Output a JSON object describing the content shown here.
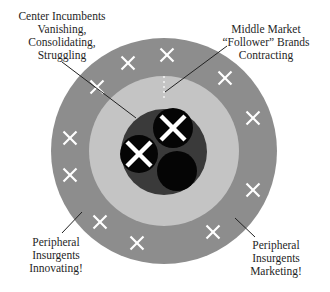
{
  "colors": {
    "background": "#ffffff",
    "outer_ring": "#8d8d8d",
    "middle_ring": "#c4c4c4",
    "core": "#3a3a3a",
    "incumbent": "#050505",
    "cross": "#ffffff",
    "leader_line": "#222222"
  },
  "labels": {
    "center": [
      "Center Incumbents",
      "Vanishing,",
      "Consolidating,",
      "Struggling"
    ],
    "middle": [
      "Middle Market",
      "“Follower” Brands",
      "Contracting"
    ],
    "peripheral_left": [
      "Peripheral",
      "Insurgents",
      "Innovating!"
    ],
    "peripheral_right": [
      "Peripheral",
      "Insurgents",
      "Marketing!"
    ]
  },
  "rings": {
    "outer": {
      "cx": 164,
      "cy": 151,
      "r": 113
    },
    "middle": {
      "cx": 164,
      "cy": 151,
      "r": 75
    },
    "core": {
      "cx": 164,
      "cy": 152,
      "r": 43
    }
  },
  "incumbents": [
    {
      "cx": 173,
      "cy": 128,
      "r": 20,
      "crossed": true
    },
    {
      "cx": 139,
      "cy": 154,
      "r": 19,
      "crossed": true
    },
    {
      "cx": 177,
      "cy": 171,
      "r": 20,
      "crossed": false
    }
  ],
  "outer_crosses": [
    {
      "x": 167,
      "y": 55
    },
    {
      "x": 128,
      "y": 63
    },
    {
      "x": 97,
      "y": 87
    },
    {
      "x": 225,
      "y": 78
    },
    {
      "x": 253,
      "y": 118
    },
    {
      "x": 70,
      "y": 138
    },
    {
      "x": 70,
      "y": 175
    },
    {
      "x": 253,
      "y": 190
    },
    {
      "x": 100,
      "y": 222
    },
    {
      "x": 213,
      "y": 232
    },
    {
      "x": 137,
      "y": 243
    }
  ],
  "leader_lines": [
    {
      "x1": 62,
      "y1": 62,
      "x2": 136,
      "y2": 118
    },
    {
      "x1": 227,
      "y1": 46,
      "x2": 165,
      "y2": 92
    },
    {
      "x1": 62,
      "y1": 233,
      "x2": 82,
      "y2": 212
    },
    {
      "x1": 235,
      "y1": 218,
      "x2": 255,
      "y2": 237
    }
  ],
  "boundary_marker": {
    "x": 164,
    "y1": 76,
    "y2": 98
  }
}
